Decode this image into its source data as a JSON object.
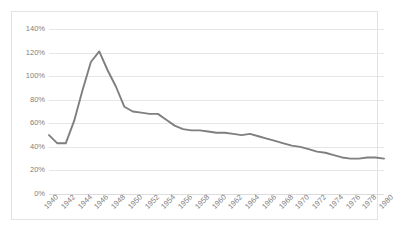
{
  "chart": {
    "title": "",
    "title_note": "CJK title clipped at top edge of screenshot — illegible",
    "line_color": "#7f7f7f",
    "grid_color": "#e6e6e6",
    "frame_color": "#e2e2e2",
    "axis_text_color": "#808080"
  },
  "chart_data": {
    "type": "line",
    "title": "",
    "xlabel": "",
    "ylabel": "",
    "ylim": [
      0,
      140
    ],
    "xlim": [
      1940,
      1980
    ],
    "grid": true,
    "legend": false,
    "y_tick_labels": [
      "140%",
      "120%",
      "100%",
      "80%",
      "60%",
      "40%",
      "20%",
      "0%"
    ],
    "y_ticks": [
      140,
      120,
      100,
      80,
      60,
      40,
      20,
      0
    ],
    "x_tick_labels": [
      "1940",
      "1942",
      "1944",
      "1946",
      "1948",
      "1950",
      "1952",
      "1954",
      "1956",
      "1958",
      "1960",
      "1962",
      "1964",
      "1966",
      "1968",
      "1970",
      "1972",
      "1974",
      "1976",
      "1978",
      "1980"
    ],
    "x_ticks": [
      1940,
      1942,
      1944,
      1946,
      1948,
      1950,
      1952,
      1954,
      1956,
      1958,
      1960,
      1962,
      1964,
      1966,
      1968,
      1970,
      1972,
      1974,
      1976,
      1978,
      1980
    ],
    "x": [
      1940,
      1941,
      1942,
      1943,
      1944,
      1945,
      1946,
      1947,
      1948,
      1949,
      1950,
      1951,
      1952,
      1953,
      1954,
      1955,
      1956,
      1957,
      1958,
      1959,
      1960,
      1961,
      1962,
      1963,
      1964,
      1965,
      1966,
      1967,
      1968,
      1969,
      1970,
      1971,
      1972,
      1973,
      1974,
      1975,
      1976,
      1977,
      1978,
      1979,
      1980
    ],
    "values": [
      50,
      43,
      43,
      62,
      88,
      112,
      121,
      105,
      91,
      74,
      70,
      69,
      68,
      68,
      63,
      58,
      55,
      54,
      54,
      53,
      52,
      52,
      51,
      50,
      51,
      49,
      47,
      45,
      43,
      41,
      40,
      38,
      36,
      35,
      33,
      31,
      30,
      30,
      31,
      31,
      30
    ],
    "series": [
      {
        "name": "series-1",
        "values": [
          50,
          43,
          43,
          62,
          88,
          112,
          121,
          105,
          91,
          74,
          70,
          69,
          68,
          68,
          63,
          58,
          55,
          54,
          54,
          53,
          52,
          52,
          51,
          50,
          51,
          49,
          47,
          45,
          43,
          41,
          40,
          38,
          36,
          35,
          33,
          31,
          30,
          30,
          31,
          31,
          30
        ]
      }
    ],
    "units": "percent"
  }
}
